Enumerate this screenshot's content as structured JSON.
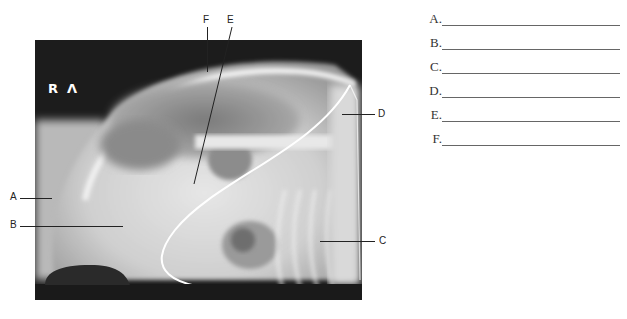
{
  "figure": {
    "type": "lateral radiograph",
    "orientation_markers": [
      "R",
      "Λ"
    ]
  },
  "callouts": [
    {
      "letter": "A",
      "side": "left"
    },
    {
      "letter": "B",
      "side": "left"
    },
    {
      "letter": "C",
      "side": "right"
    },
    {
      "letter": "D",
      "side": "right"
    },
    {
      "letter": "E",
      "side": "top"
    },
    {
      "letter": "F",
      "side": "top"
    }
  ],
  "answers": [
    {
      "letter": "A.",
      "value": ""
    },
    {
      "letter": "B.",
      "value": ""
    },
    {
      "letter": "C.",
      "value": ""
    },
    {
      "letter": "D.",
      "value": ""
    },
    {
      "letter": "E.",
      "value": ""
    },
    {
      "letter": "F.",
      "value": ""
    }
  ]
}
